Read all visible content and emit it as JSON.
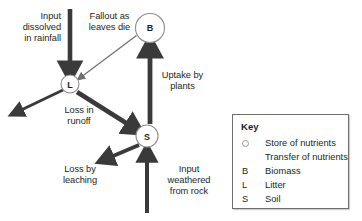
{
  "diagram": {
    "nodes": [
      {
        "id": "B",
        "label": "B",
        "name": "Biomass",
        "cx": 150,
        "cy": 28,
        "r": 14.5
      },
      {
        "id": "L",
        "label": "L",
        "name": "Litter",
        "cx": 70,
        "cy": 84,
        "r": 9
      },
      {
        "id": "S",
        "label": "S",
        "name": "Soil",
        "cx": 147,
        "cy": 136,
        "r": 11
      }
    ],
    "labels": [
      {
        "id": "input-rainfall",
        "text": "Input\ndissolved\nin rainfall",
        "align": "right"
      },
      {
        "id": "fallout-leaves",
        "text": "Fallout as\nleaves die",
        "align": "center"
      },
      {
        "id": "uptake-plants",
        "text": "Uptake by\nplants",
        "align": "center"
      },
      {
        "id": "loss-runoff",
        "text": "Loss in\nrunoff",
        "align": "center"
      },
      {
        "id": "loss-leaching",
        "text": "Loss by\nleaching",
        "align": "center"
      },
      {
        "id": "input-weathered",
        "text": "Input\nweathered\nfrom rock",
        "align": "center"
      }
    ],
    "colors": {
      "ink": "#231f20",
      "arrow_dark": "#3a3a3a",
      "arrow_light": "#7b7b7b",
      "node_stroke": "#8d8d8d",
      "legend_border": "#6d6e71"
    }
  },
  "legend": {
    "title": "Key",
    "rows": [
      {
        "symbol": "circle-outline-icon",
        "letter": "",
        "text": "Store of nutrients"
      },
      {
        "symbol": "arrow-right-icon",
        "letter": "",
        "text": "Transfer of nutrients"
      },
      {
        "symbol": "letter",
        "letter": "B",
        "text": "Biomass"
      },
      {
        "symbol": "letter",
        "letter": "L",
        "text": "Litter"
      },
      {
        "symbol": "letter",
        "letter": "S",
        "text": "Soil"
      }
    ]
  }
}
